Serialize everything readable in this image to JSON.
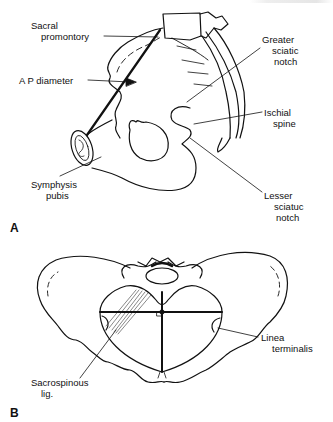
{
  "figure": {
    "panel_a": {
      "letter": "A",
      "labels": {
        "sacral_promontory_1": "Sacral",
        "sacral_promontory_2": "promontory",
        "ap_diameter": "A P diameter",
        "greater_sciatic_1": "Greater",
        "greater_sciatic_2": "sciatic",
        "greater_sciatic_3": "notch",
        "ischial_spine_1": "Ischial",
        "ischial_spine_2": "spine",
        "symphysis_1": "Symphysis",
        "symphysis_2": "pubis",
        "lesser_sciatic_1": "Lesser",
        "lesser_sciatic_2": "sciatuc",
        "lesser_sciatic_3": "notch"
      }
    },
    "panel_b": {
      "letter": "B",
      "labels": {
        "linea_terminalis_1": "Linea",
        "linea_terminalis_2": "terminalis",
        "sacrospinous_1": "Sacrospinous",
        "sacrospinous_2": "lig."
      }
    },
    "colors": {
      "line": "#111111",
      "background": "#ffffff"
    }
  }
}
